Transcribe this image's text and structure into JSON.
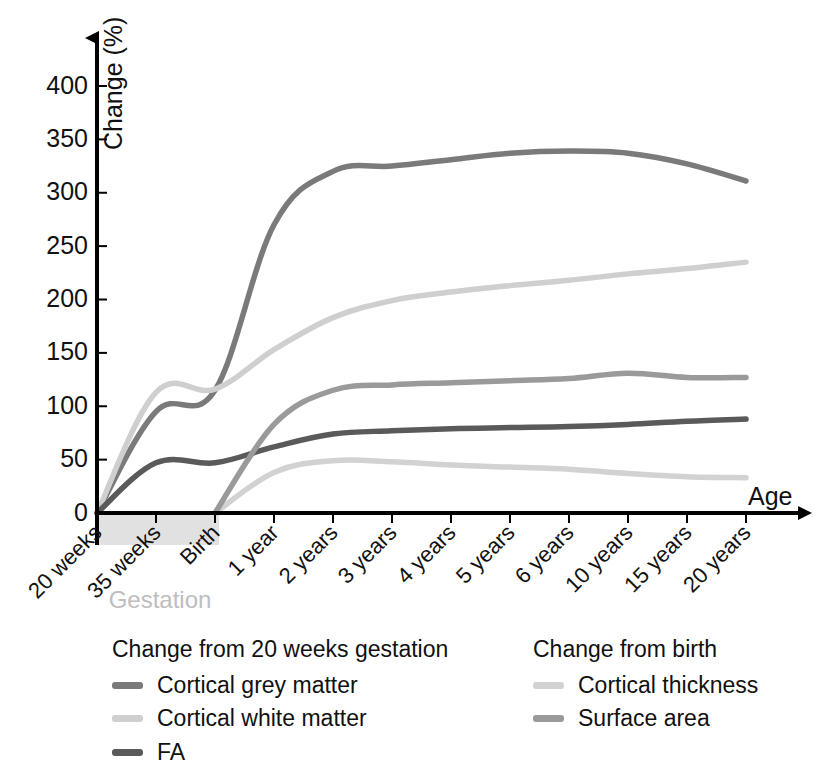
{
  "chart_data": {
    "type": "line",
    "title": "",
    "xlabel": "Age",
    "ylabel": "Change (%)",
    "ylim": [
      0,
      430
    ],
    "yticks": [
      0,
      50,
      100,
      150,
      200,
      250,
      300,
      350,
      400
    ],
    "grid": false,
    "legend_position": "below-plot",
    "categories": [
      "20 weeks",
      "35 weeks",
      "Birth",
      "1 year",
      "2 years",
      "3 years",
      "4 years",
      "5 years",
      "6 years",
      "10 years",
      "15 years",
      "20 years"
    ],
    "annotations": [
      {
        "text": "Gestation",
        "span": [
          "20 weeks",
          "Birth"
        ],
        "type": "shaded-band-label"
      }
    ],
    "series": [
      {
        "name": "Cortical grey matter",
        "group": "Change from 20 weeks gestation",
        "color": "#7a7a7a",
        "values": [
          0,
          95,
          115,
          270,
          320,
          325,
          331,
          337,
          339,
          337,
          327,
          311
        ]
      },
      {
        "name": "Cortical white matter",
        "group": "Change from 20 weeks gestation",
        "color": "#cfcfcf",
        "values": [
          0,
          113,
          116,
          153,
          183,
          199,
          207,
          213,
          218,
          224,
          229,
          235
        ]
      },
      {
        "name": "FA",
        "group": "Change from 20 weeks gestation",
        "color": "#5a5a5a",
        "values": [
          0,
          47,
          47,
          62,
          74,
          77,
          79,
          80,
          81,
          83,
          86,
          88
        ]
      },
      {
        "name": "Cortical thickness",
        "group": "Change from birth",
        "color": "#d2d2d2",
        "values": [
          null,
          null,
          0,
          38,
          49,
          48,
          45,
          43,
          41,
          37,
          34,
          33
        ]
      },
      {
        "name": "Surface area",
        "group": "Change from birth",
        "color": "#9a9a9a",
        "values": [
          null,
          null,
          0,
          83,
          115,
          120,
          122,
          124,
          126,
          131,
          127,
          127
        ]
      }
    ]
  },
  "axes": {
    "y_title": "Change (%)",
    "x_title": "Age",
    "y_ticks": [
      "400",
      "350",
      "300",
      "250",
      "200",
      "150",
      "100",
      "50",
      "0"
    ],
    "x_ticks": [
      "20 weeks",
      "35 weeks",
      "Birth",
      "1 year",
      "2 years",
      "3 years",
      "4 years",
      "5 years",
      "6 years",
      "10 years",
      "15 years",
      "20 years"
    ],
    "band_label": "Gestation"
  },
  "legend": {
    "left": {
      "title": "Change from 20 weeks gestation",
      "items": [
        {
          "label": "Cortical grey matter",
          "color": "#7a7a7a"
        },
        {
          "label": "Cortical white matter",
          "color": "#cfcfcf"
        },
        {
          "label": "FA",
          "color": "#5a5a5a"
        }
      ]
    },
    "right": {
      "title": "Change from birth",
      "items": [
        {
          "label": "Cortical thickness",
          "color": "#d2d2d2"
        },
        {
          "label": "Surface area",
          "color": "#9a9a9a"
        }
      ]
    }
  }
}
